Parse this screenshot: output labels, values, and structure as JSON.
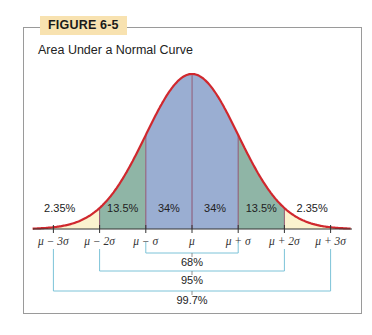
{
  "figure": {
    "tag": "FIGURE 6-5",
    "title": "Area Under a Normal Curve"
  },
  "colors": {
    "curve": "#d0282e",
    "center_fill": "#9aaed2",
    "mid_fill": "#8fb5a6",
    "tail_fill": "#fbf3cf",
    "bracket": "#7cc3d8",
    "tag_bg": "#f8e2b0"
  },
  "chart_data": {
    "type": "area",
    "title": "Area Under a Normal Curve",
    "xlabel": "",
    "ylabel": "",
    "x_ticks": [
      "μ − 3σ",
      "μ − 2σ",
      "μ − σ",
      "μ",
      "μ + σ",
      "μ + 2σ",
      "μ + 3σ"
    ],
    "regions": [
      {
        "from": "μ − 3σ",
        "to": "μ − 2σ",
        "label": "2.35%",
        "value": 2.35
      },
      {
        "from": "μ − 2σ",
        "to": "μ − σ",
        "label": "13.5%",
        "value": 13.5
      },
      {
        "from": "μ − σ",
        "to": "μ",
        "label": "34%",
        "value": 34
      },
      {
        "from": "μ",
        "to": "μ + σ",
        "label": "34%",
        "value": 34
      },
      {
        "from": "μ + σ",
        "to": "μ + 2σ",
        "label": "13.5%",
        "value": 13.5
      },
      {
        "from": "μ + 2σ",
        "to": "μ + 3σ",
        "label": "2.35%",
        "value": 2.35
      }
    ],
    "brackets": [
      {
        "range": "μ ± σ",
        "label": "68%",
        "value": 68
      },
      {
        "range": "μ ± 2σ",
        "label": "95%",
        "value": 95
      },
      {
        "range": "μ ± 3σ",
        "label": "99.7%",
        "value": 99.7
      }
    ],
    "grid": false,
    "legend": null
  }
}
